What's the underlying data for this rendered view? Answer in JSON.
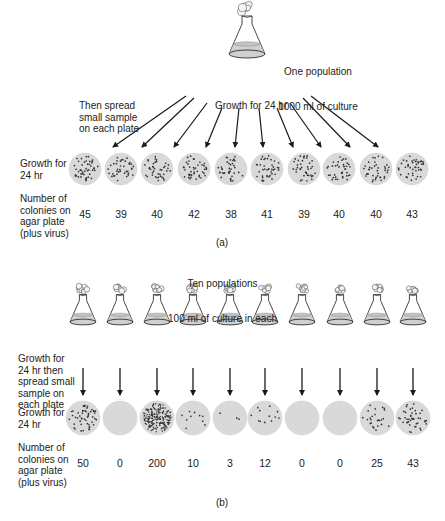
{
  "panel_a": {
    "title_line1": "One population",
    "title_line2": "1000 ml of culture",
    "spread_label": "Then spread\nsmall sample\non each plate",
    "growth_arrow_label": "Growth for 24 hr",
    "growth_row_label": "Growth for\n24 hr",
    "count_row_label": "Number of\ncolonies on\nagar plate\n(plus virus)",
    "caption": "(a)",
    "plates": [
      {
        "x": 85,
        "count": "45"
      },
      {
        "x": 121,
        "count": "39"
      },
      {
        "x": 157,
        "count": "40"
      },
      {
        "x": 194,
        "count": "42"
      },
      {
        "x": 231,
        "count": "38"
      },
      {
        "x": 267,
        "count": "41"
      },
      {
        "x": 304,
        "count": "39"
      },
      {
        "x": 339,
        "count": "40"
      },
      {
        "x": 376,
        "count": "40"
      },
      {
        "x": 412,
        "count": "43"
      }
    ]
  },
  "panel_b": {
    "title_line1": "Ten populations",
    "title_line2": "100 ml of culture in each",
    "growth_spread_label": "Growth for\n24 hr then\nspread small\nsample on\neach plate",
    "growth_row_label": "Growth for\n24 hr",
    "count_row_label": "Number of\ncolonies on\nagar plate\n(plus virus)",
    "caption": "(b)",
    "plates": [
      {
        "x": 83,
        "count": "50"
      },
      {
        "x": 120,
        "count": "0"
      },
      {
        "x": 157,
        "count": "200"
      },
      {
        "x": 193,
        "count": "10"
      },
      {
        "x": 230,
        "count": "3"
      },
      {
        "x": 265,
        "count": "12"
      },
      {
        "x": 302,
        "count": "0"
      },
      {
        "x": 340,
        "count": "0"
      },
      {
        "x": 377,
        "count": "25"
      },
      {
        "x": 413,
        "count": "43"
      }
    ]
  },
  "colors": {
    "plate_fill": "#d9d9d9",
    "liquid_fill": "#d0d0d0",
    "line": "#1a1a1a",
    "colony": "#333333"
  }
}
